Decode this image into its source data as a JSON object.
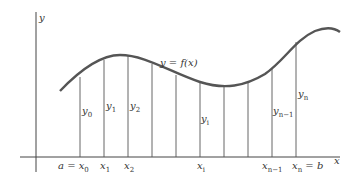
{
  "diagram": {
    "curve_label": "y = f(x)",
    "axes": {
      "x_label": "x",
      "y_label": "y"
    },
    "colors": {
      "curve": "#555555",
      "lines": "#444444",
      "text": "#333333"
    },
    "x_tick_labels": [
      {
        "main": "a = x",
        "sub": "0"
      },
      {
        "main": "x",
        "sub": "1"
      },
      {
        "main": "x",
        "sub": "2"
      },
      {
        "main": "x",
        "sub": "i"
      },
      {
        "main": "x",
        "sub": "n−1"
      },
      {
        "main": "x",
        "sub": "n",
        "suffix": " = b"
      }
    ],
    "ordinate_labels": [
      {
        "main": "y",
        "sub": "0"
      },
      {
        "main": "y",
        "sub": "1"
      },
      {
        "main": "y",
        "sub": "2"
      },
      {
        "main": "y",
        "sub": "i"
      },
      {
        "main": "y",
        "sub": "n−1"
      },
      {
        "main": "y",
        "sub": "n"
      }
    ]
  }
}
